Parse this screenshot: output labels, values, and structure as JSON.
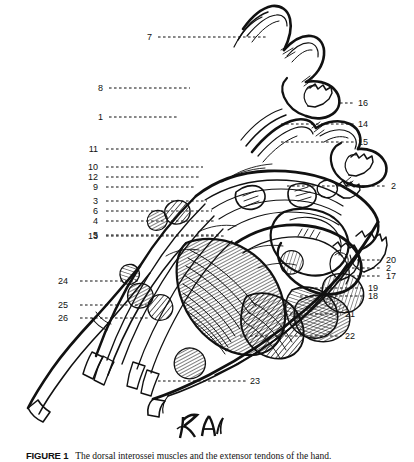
{
  "figure": {
    "caption_label": "FIGURE 1",
    "caption_text": "The dorsal interossei muscles and the extensor tendons of the hand.",
    "artist_signature": "AK",
    "ink_color": "#111111",
    "background_color": "#ffffff"
  },
  "leaders": [
    {
      "id": "7",
      "text": "7",
      "side": "left",
      "label_x": 152,
      "label_y": 37,
      "line_x1": 158,
      "line_x2": 268,
      "line_y": 37
    },
    {
      "id": "8",
      "text": "8",
      "side": "left",
      "label_x": 103,
      "label_y": 88,
      "line_x1": 109,
      "line_x2": 190,
      "line_y": 88
    },
    {
      "id": "1",
      "text": "1",
      "side": "left",
      "label_x": 103,
      "label_y": 117,
      "line_x1": 109,
      "line_x2": 177,
      "line_y": 117
    },
    {
      "id": "11",
      "text": "11",
      "side": "left",
      "label_x": 98,
      "label_y": 149,
      "line_x1": 106,
      "line_x2": 188,
      "line_y": 149
    },
    {
      "id": "10",
      "text": "10",
      "side": "left",
      "label_x": 98,
      "label_y": 167,
      "line_x1": 106,
      "line_x2": 203,
      "line_y": 167
    },
    {
      "id": "12",
      "text": "12",
      "side": "left",
      "label_x": 98,
      "label_y": 177,
      "line_x1": 106,
      "line_x2": 200,
      "line_y": 177
    },
    {
      "id": "9",
      "text": "9",
      "side": "left",
      "label_x": 98,
      "label_y": 187,
      "line_x1": 106,
      "line_x2": 196,
      "line_y": 187
    },
    {
      "id": "3",
      "text": "3",
      "side": "left",
      "label_x": 98,
      "label_y": 201,
      "line_x1": 106,
      "line_x2": 207,
      "line_y": 201
    },
    {
      "id": "6",
      "text": "6",
      "side": "left",
      "label_x": 98,
      "label_y": 211,
      "line_x1": 106,
      "line_x2": 212,
      "line_y": 211
    },
    {
      "id": "4",
      "text": "4",
      "side": "left",
      "label_x": 98,
      "label_y": 221,
      "line_x1": 106,
      "line_x2": 215,
      "line_y": 221
    },
    {
      "id": "5",
      "text": "5",
      "side": "left",
      "label_x": 98,
      "label_y": 235,
      "line_x1": 106,
      "line_x2": 220,
      "line_y": 235
    },
    {
      "id": "13",
      "text": "13",
      "side": "left",
      "label_x": 98,
      "label_y": 236,
      "line_x1": 106,
      "line_x2": 224,
      "line_y": 236
    },
    {
      "id": "24",
      "text": "24",
      "side": "left",
      "label_x": 68,
      "label_y": 281,
      "line_x1": 80,
      "line_x2": 140,
      "line_y": 281
    },
    {
      "id": "25",
      "text": "25",
      "side": "left",
      "label_x": 68,
      "label_y": 305,
      "line_x1": 80,
      "line_x2": 148,
      "line_y": 305
    },
    {
      "id": "26",
      "text": "26",
      "side": "left",
      "label_x": 68,
      "label_y": 318,
      "line_x1": 80,
      "line_x2": 150,
      "line_y": 318
    },
    {
      "id": "16",
      "text": "16",
      "side": "right",
      "label_x": 358,
      "label_y": 103,
      "line_x1": 340,
      "line_x2": 354,
      "line_y": 103
    },
    {
      "id": "14",
      "text": "14",
      "side": "right",
      "label_x": 358,
      "label_y": 124,
      "line_x1": 281,
      "line_x2": 354,
      "line_y": 124
    },
    {
      "id": "15",
      "text": "15",
      "side": "right",
      "label_x": 358,
      "label_y": 142,
      "line_x1": 281,
      "line_x2": 354,
      "line_y": 142
    },
    {
      "id": "2r",
      "text": "2",
      "side": "right",
      "label_x": 391,
      "label_y": 186,
      "line_x1": 287,
      "line_x2": 387,
      "line_y": 186
    },
    {
      "id": "20",
      "text": "20",
      "side": "right",
      "label_x": 386,
      "label_y": 260,
      "line_x1": 352,
      "line_x2": 382,
      "line_y": 260
    },
    {
      "id": "2b",
      "text": "2",
      "side": "right",
      "label_x": 386,
      "label_y": 268,
      "line_x1": 352,
      "line_x2": 382,
      "line_y": 268
    },
    {
      "id": "17",
      "text": "17",
      "side": "right",
      "label_x": 386,
      "label_y": 276,
      "line_x1": 352,
      "line_x2": 382,
      "line_y": 276
    },
    {
      "id": "19",
      "text": "19",
      "side": "right",
      "label_x": 368,
      "label_y": 288,
      "line_x1": 300,
      "line_x2": 364,
      "line_y": 288
    },
    {
      "id": "18",
      "text": "18",
      "side": "right",
      "label_x": 368,
      "label_y": 296,
      "line_x1": 300,
      "line_x2": 364,
      "line_y": 296
    },
    {
      "id": "21",
      "text": "21",
      "side": "right",
      "label_x": 345,
      "label_y": 314,
      "line_x1": 280,
      "line_x2": 341,
      "line_y": 314
    },
    {
      "id": "22",
      "text": "22",
      "side": "right",
      "label_x": 345,
      "label_y": 336,
      "line_x1": 240,
      "line_x2": 341,
      "line_y": 336
    },
    {
      "id": "23",
      "text": "23",
      "side": "right",
      "label_x": 250,
      "label_y": 381,
      "line_x1": 158,
      "line_x2": 246,
      "line_y": 381
    }
  ]
}
